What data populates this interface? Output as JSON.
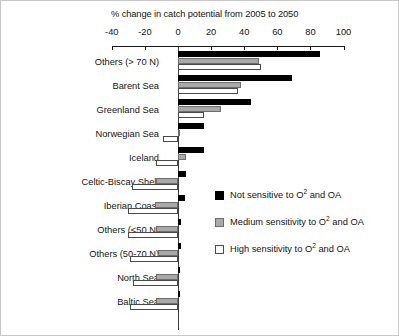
{
  "chart_data": {
    "type": "bar",
    "orientation": "horizontal",
    "title": "% change in catch potential from 2005 to 2050",
    "xlabel": "",
    "ylabel": "",
    "xlim": [
      -40,
      100
    ],
    "xticks": [
      -40,
      -20,
      0,
      20,
      40,
      60,
      80,
      100
    ],
    "xtick_labels": [
      "-40",
      "-20",
      "0",
      "20",
      "40",
      "60",
      "80",
      "100"
    ],
    "grid": false,
    "legend_position": "inside-right",
    "categories": [
      "Others (> 70 N)",
      "Barent Sea",
      "Greenland Sea",
      "Norwegian Sea",
      "Iceland",
      "Celtic-Biscay Shelf",
      "Iberian Coast",
      "Others (<50 N)",
      "Others (50-70 N)",
      "North Sea",
      "Baltic Sea"
    ],
    "series": [
      {
        "name": "Not sensitive to O2 and OA",
        "name_html": "Not sensitive to O<sup>2</sup> and OA",
        "color": "#000000",
        "values": [
          86,
          69,
          44,
          16,
          16,
          5,
          4,
          2,
          2,
          1,
          0
        ]
      },
      {
        "name": "Medium sensitivity to O2 and OA",
        "name_html": "Medium sensitivity to O<sup>2</sup> and OA",
        "color": "#a9a9a9",
        "values": [
          49,
          38,
          26,
          1,
          5,
          -13,
          -14,
          -13,
          -12,
          -13,
          -13
        ]
      },
      {
        "name": "High sensitivity to O2 and OA",
        "name_html": "High sensitivity to O<sup>2</sup> and OA",
        "color": "#ffffff",
        "values": [
          50,
          36,
          16,
          -9,
          -13,
          -28,
          -30,
          -30,
          -29,
          -27,
          -29
        ]
      }
    ]
  },
  "legend": {
    "items": [
      {
        "swatch": "black",
        "label": "Not sensitive to O",
        "sup": "2",
        "tail": " and OA"
      },
      {
        "swatch": "gray",
        "label": "Medium sensitivity to O",
        "sup": "2",
        "tail": " and OA"
      },
      {
        "swatch": "white",
        "label": "High sensitivity to O",
        "sup": "2",
        "tail": " and OA"
      }
    ]
  }
}
